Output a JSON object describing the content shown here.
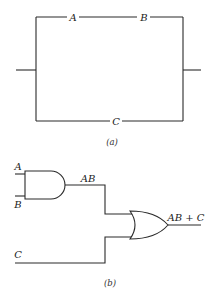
{
  "figure_a": {
    "caption": "(a)",
    "description": "Switching circuit: series switches A and B in parallel with switch C",
    "top_branch": {
      "switches": [
        {
          "label": "A"
        },
        {
          "label": "B"
        }
      ]
    },
    "bottom_branch": {
      "switches": [
        {
          "label": "C"
        }
      ]
    }
  },
  "figure_b": {
    "caption": "(b)",
    "description": "Logic gate circuit: AND gate of A and B feeding an OR gate with C",
    "and_gate": {
      "inputs": [
        "A",
        "B"
      ],
      "output_label": "AB"
    },
    "or_gate": {
      "inputs": [
        "AB",
        "C"
      ],
      "output_label": "AB + C"
    },
    "input_c_label": "C"
  },
  "colors": {
    "line": "#2a2a2a",
    "text": "#222222",
    "background": "#ffffff"
  }
}
